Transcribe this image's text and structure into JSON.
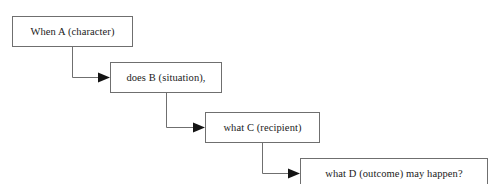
{
  "diagram": {
    "type": "flowchart",
    "orientation": "cascading-left-to-right",
    "nodes": [
      {
        "id": "node-1",
        "label": "When A (character)"
      },
      {
        "id": "node-2",
        "label": "does B (situation),"
      },
      {
        "id": "node-3",
        "label": "what C (recipient)"
      },
      {
        "id": "node-4",
        "label": "what D (outcome) may happen?"
      }
    ],
    "edges": [
      {
        "id": "edge-1",
        "from": "node-1",
        "to": "node-2",
        "style": "elbow-down-right",
        "arrowhead": "filled-triangle"
      },
      {
        "id": "edge-2",
        "from": "node-2",
        "to": "node-3",
        "style": "elbow-down-right",
        "arrowhead": "filled-triangle"
      },
      {
        "id": "edge-3",
        "from": "node-3",
        "to": "node-4",
        "style": "elbow-down-right",
        "arrowhead": "filled-triangle"
      }
    ],
    "colors": {
      "box_border": "#6f6f6f",
      "box_fill": "#ffffff",
      "text": "#1a1a1a",
      "connector_line": "#6f6f6f",
      "arrowhead": "#141414",
      "background": "#ffffff"
    }
  }
}
